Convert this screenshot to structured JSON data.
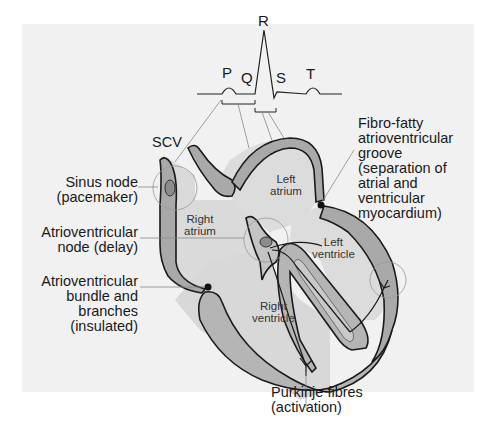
{
  "figure": {
    "background_panel_color": "#f1f1f1",
    "tissue_color_dark": "#a9a9a9",
    "tissue_color_light": "#d4d4d4",
    "node_color": "#8c8c8c"
  },
  "ecg": {
    "waves": [
      "P",
      "Q",
      "R",
      "S",
      "T"
    ]
  },
  "chambers": {
    "right_atrium": [
      "Right",
      "atrium"
    ],
    "left_atrium": [
      "Left",
      "atrium"
    ],
    "right_ventricle": [
      "Right",
      "ventricle"
    ],
    "left_ventricle": [
      "Left",
      "ventricle"
    ]
  },
  "labels": {
    "scv": "SCV",
    "sinus_node": [
      "Sinus node",
      "(pacemaker)"
    ],
    "av_node": [
      "Atrioventricular",
      "node (delay)"
    ],
    "av_bundle": [
      "Atrioventricular",
      "bundle and",
      "branches",
      "(insulated)"
    ],
    "fibro_fatty": [
      "Fibro-fatty",
      "atrioventricular",
      "groove",
      "(separation of",
      "atrial and",
      "ventricular",
      "myocardium)"
    ],
    "purkinje": [
      "Purkinje fibres",
      "(activation)"
    ]
  }
}
